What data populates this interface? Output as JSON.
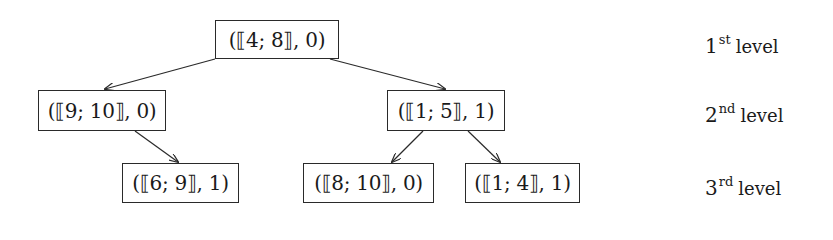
{
  "tree": {
    "nodes": [
      {
        "id": "root",
        "label": "(⟦4; 8⟧, 0)",
        "level": 1
      },
      {
        "id": "l2a",
        "label": "(⟦9; 10⟧, 0)",
        "level": 2
      },
      {
        "id": "l2b",
        "label": "(⟦1; 5⟧, 1)",
        "level": 2
      },
      {
        "id": "l3a",
        "label": "(⟦6; 9⟧, 1)",
        "level": 3
      },
      {
        "id": "l3b",
        "label": "(⟦8; 10⟧, 0)",
        "level": 3
      },
      {
        "id": "l3c",
        "label": "(⟦1; 4⟧, 1)",
        "level": 3
      }
    ],
    "edges": [
      {
        "from": "root",
        "to": "l2a"
      },
      {
        "from": "root",
        "to": "l2b"
      },
      {
        "from": "l2a",
        "to": "l3a"
      },
      {
        "from": "l2b",
        "to": "l3b"
      },
      {
        "from": "l2b",
        "to": "l3c"
      }
    ]
  },
  "levels": [
    {
      "num": "1",
      "suffix": "st",
      "word": "level"
    },
    {
      "num": "2",
      "suffix": "nd",
      "word": "level"
    },
    {
      "num": "3",
      "suffix": "rd",
      "word": "level"
    }
  ]
}
